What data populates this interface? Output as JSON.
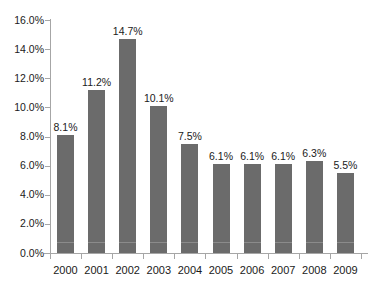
{
  "chart_data": {
    "type": "bar",
    "title": "",
    "xlabel": "",
    "ylabel": "",
    "categories": [
      "2000",
      "2001",
      "2002",
      "2003",
      "2004",
      "2005",
      "2006",
      "2007",
      "2008",
      "2009"
    ],
    "values": [
      8.1,
      11.2,
      14.7,
      10.1,
      7.5,
      6.1,
      6.1,
      6.1,
      6.3,
      5.5
    ],
    "data_labels": [
      "8.1%",
      "11.2%",
      "14.7%",
      "10.1%",
      "7.5%",
      "6.1%",
      "6.1%",
      "6.1%",
      "6.3%",
      "5.5%"
    ],
    "ylim": [
      0,
      16
    ],
    "ytick_step": 2,
    "ytick_labels": [
      "16.0%",
      "14.0%",
      "12.0%",
      "10.0%",
      "8.0%",
      "6.0%",
      "4.0%",
      "2.0%",
      "0.0%"
    ],
    "ytick_values": [
      16,
      14,
      12,
      10,
      8,
      6,
      4,
      2,
      0
    ],
    "grid": false,
    "legend": false,
    "series_color": "#6b6b6b",
    "axis_color": "#a6a6a6",
    "units": "percent"
  }
}
